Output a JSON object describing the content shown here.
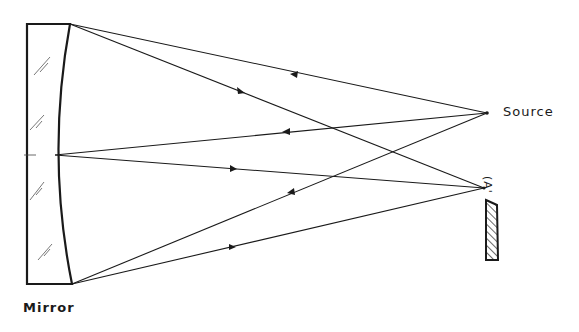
{
  "diagram": {
    "type": "optical ray diagram - concave mirror imaging a source",
    "labels": {
      "mirror": "Mirror",
      "source": "Source",
      "image": "(A'"
    },
    "elements": [
      {
        "name": "Mirror",
        "kind": "concave spherical mirror with glass substrate"
      },
      {
        "name": "Source",
        "kind": "point source"
      },
      {
        "name": "A'",
        "kind": "image point"
      },
      {
        "name": "screen",
        "kind": "hatched block / detector plate"
      }
    ],
    "colors": {
      "ink": "#1a1a1a",
      "background": "#ffffff"
    }
  }
}
